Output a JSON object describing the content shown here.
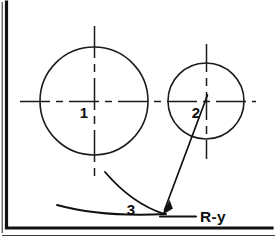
{
  "figure": {
    "background_color": "#ffffff",
    "line_color": "#1a1a1a",
    "frame_color": "#111111"
  },
  "labels": {
    "circle_one": "1",
    "circle_two": "2",
    "arc_three": "3",
    "dimension": "R-y"
  },
  "geometry": {
    "circle_one": {
      "cx": 94,
      "cy": 101,
      "r": 54
    },
    "circle_two": {
      "cx": 206,
      "cy": 101,
      "r": 38
    },
    "horizontal_centerline": {
      "x1": 20,
      "x2": 256,
      "y": 101
    },
    "vertical_centerline_one": {
      "x": 94,
      "y1": 26,
      "y2": 176
    },
    "vertical_centerline_two": {
      "x": 206,
      "y1": 44,
      "y2": 159
    },
    "leader_start": {
      "x": 207,
      "y": 96
    },
    "leader_tip": {
      "x": 163,
      "y": 213
    },
    "arc_upper_start": {
      "x": 105,
      "y": 172
    },
    "arc_lower_start": {
      "x": 57,
      "y": 205
    }
  }
}
